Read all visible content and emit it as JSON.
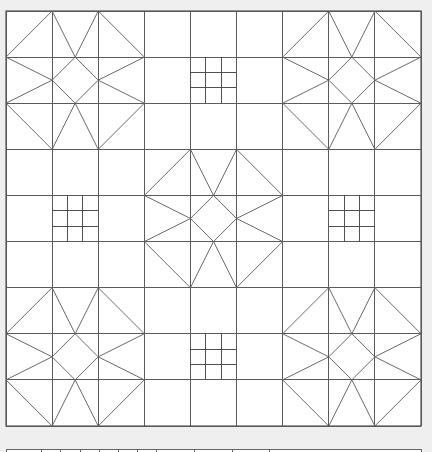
{
  "diagram": {
    "type": "quilt-pattern",
    "grid": {
      "cols": 9,
      "rows": 9,
      "origin_x": 6,
      "origin_y": 11,
      "size": 415
    },
    "colors": {
      "page_background": "#efefef",
      "grid_fill": "#ffffff",
      "grid_line": "#5a5a5a",
      "star_line": "#6a6a6a",
      "nine_patch_line": "#505050"
    },
    "star_blocks": [
      {
        "block_col": 0,
        "block_row": 0
      },
      {
        "block_col": 2,
        "block_row": 0
      },
      {
        "block_col": 1,
        "block_row": 1
      },
      {
        "block_col": 0,
        "block_row": 2
      },
      {
        "block_col": 2,
        "block_row": 2
      }
    ],
    "nine_patch_cells": [
      {
        "col": 4,
        "row": 1
      },
      {
        "col": 1,
        "row": 4
      },
      {
        "col": 7,
        "row": 4
      },
      {
        "col": 4,
        "row": 7
      }
    ],
    "star_segments": [
      [
        [
          0,
          1
        ],
        [
          1,
          0
        ]
      ],
      [
        [
          2,
          0
        ],
        [
          3,
          1
        ]
      ],
      [
        [
          3,
          2
        ],
        [
          2,
          3
        ]
      ],
      [
        [
          1,
          3
        ],
        [
          0,
          2
        ]
      ],
      [
        [
          1,
          0
        ],
        [
          1.5,
          1
        ]
      ],
      [
        [
          2,
          0
        ],
        [
          1.5,
          1
        ]
      ],
      [
        [
          0,
          1
        ],
        [
          1,
          1.5
        ]
      ],
      [
        [
          0,
          2
        ],
        [
          1,
          1.5
        ]
      ],
      [
        [
          3,
          1
        ],
        [
          2,
          1.5
        ]
      ],
      [
        [
          3,
          2
        ],
        [
          2,
          1.5
        ]
      ],
      [
        [
          1,
          3
        ],
        [
          1.5,
          2
        ]
      ],
      [
        [
          2,
          3
        ],
        [
          1.5,
          2
        ]
      ],
      [
        [
          1.5,
          1
        ],
        [
          2,
          1.5
        ]
      ],
      [
        [
          2,
          1.5
        ],
        [
          1.5,
          2
        ]
      ],
      [
        [
          1.5,
          2
        ],
        [
          1,
          1.5
        ]
      ],
      [
        [
          1,
          1.5
        ],
        [
          1.5,
          1
        ]
      ]
    ],
    "bottom_strip": {
      "y": 449,
      "x_start": 6,
      "x_end": 421,
      "ticks_x": [
        41,
        60,
        80,
        99,
        118,
        137,
        156,
        194,
        232,
        269
      ]
    }
  }
}
